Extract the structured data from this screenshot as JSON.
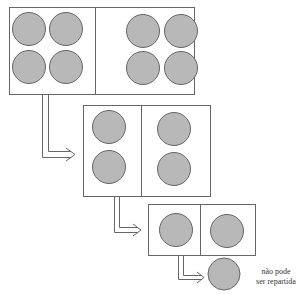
{
  "diagram": {
    "colors": {
      "circle_fill": "#b8b8b8",
      "circle_stroke": "#666666",
      "line": "#666666"
    },
    "stages": [
      {
        "id": "stage-1",
        "box": {
          "x": 9,
          "y": 7,
          "w": 185,
          "h": 87
        },
        "divider_x": 95,
        "circles": [
          [
            29,
            29
          ],
          [
            66,
            29
          ],
          [
            29,
            67
          ],
          [
            66,
            67
          ],
          [
            143,
            31
          ],
          [
            181,
            31
          ],
          [
            143,
            68
          ],
          [
            181,
            68
          ]
        ],
        "r": 16.5
      },
      {
        "id": "stage-2",
        "box": {
          "x": 83,
          "y": 105,
          "w": 127,
          "h": 91
        },
        "divider_x": 141,
        "circles": [
          [
            109,
            127
          ],
          [
            109,
            167
          ],
          [
            174,
            129
          ],
          [
            174,
            169
          ]
        ],
        "r": 16.5
      },
      {
        "id": "stage-3",
        "box": {
          "x": 148,
          "y": 204,
          "w": 107,
          "h": 51
        },
        "divider_x": 200,
        "circles": [
          [
            176,
            230
          ],
          [
            227,
            231
          ]
        ],
        "r": 16.5
      },
      {
        "id": "stage-4",
        "box": null,
        "divider_x": null,
        "circles": [
          [
            224,
            274
          ]
        ],
        "r": 16
      }
    ],
    "note": {
      "line1": "não pode",
      "line2": "ser repartida"
    }
  }
}
